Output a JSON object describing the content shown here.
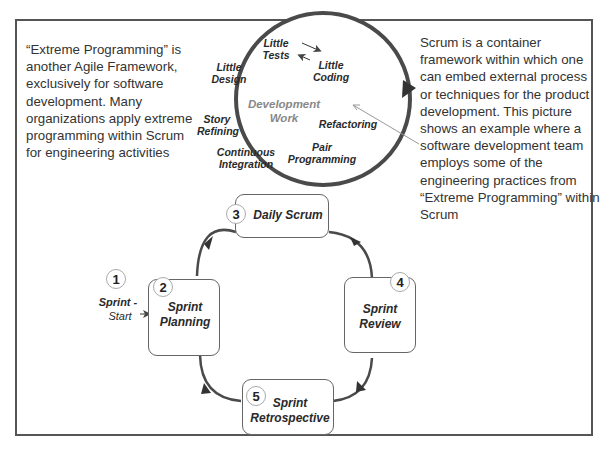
{
  "left_note": "“Extreme Programming” is another Agile Framework, exclusively for software development. Many organizations apply extreme programming within Scrum for engineering activities",
  "right_note": "Scrum is a container framework within which one can embed external process or techniques for the product development. This picture shows an example where a software development team employs some of the engineering practices from “Extreme Programming” within Scrum",
  "development_circle": {
    "center_label": "Development Work",
    "practices": {
      "little_tests": "Little Tests",
      "little_coding": "Little Coding",
      "little_design": "Little Design",
      "story_refining": "Story Refining",
      "refactoring": "Refactoring",
      "continuous_integration": "Continuous Integration",
      "pair_programming": "Pair Programming"
    }
  },
  "sprint_start": {
    "number": "1",
    "label_bold": "Sprint -",
    "label_regular": "Start"
  },
  "steps": [
    {
      "number": "2",
      "label": "Sprint Planning"
    },
    {
      "number": "3",
      "label": "Daily Scrum"
    },
    {
      "number": "4",
      "label": "Sprint Review"
    },
    {
      "number": "5",
      "label": "Sprint Retrospective"
    }
  ]
}
